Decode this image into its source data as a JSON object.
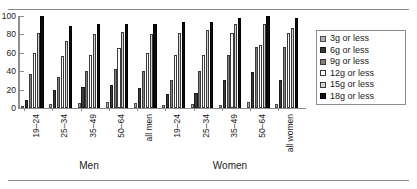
{
  "chart_data": {
    "type": "bar",
    "title": "",
    "xlabel": "",
    "ylabel": "",
    "ylim": [
      0,
      100
    ],
    "yticks": [
      0,
      20,
      40,
      60,
      80,
      100
    ],
    "grid": false,
    "legend_position": "right",
    "categories": [
      "19–24",
      "25–34",
      "35–49",
      "50–64",
      "all men",
      "19–24",
      "25–34",
      "35–49",
      "50–64",
      "all women"
    ],
    "group_titles": [
      "Men",
      "Women"
    ],
    "series": [
      {
        "name": "3g or less",
        "values": [
          1,
          4,
          5,
          6,
          5,
          3,
          4,
          3,
          7,
          4
        ]
      },
      {
        "name": "6g or less",
        "values": [
          9,
          20,
          23,
          25,
          22,
          15,
          16,
          30,
          39,
          30
        ]
      },
      {
        "name": "9g or less",
        "values": [
          37,
          34,
          40,
          42,
          40,
          30,
          40,
          58,
          66,
          66
        ]
      },
      {
        "name": "12g or less",
        "values": [
          60,
          57,
          58,
          65,
          60,
          58,
          58,
          82,
          69,
          81
        ]
      },
      {
        "name": "15g or less",
        "values": [
          81,
          73,
          80,
          83,
          80,
          82,
          85,
          91,
          91,
          87
        ]
      },
      {
        "name": "18g or less",
        "values": [
          100,
          89,
          91,
          91,
          91,
          93,
          93,
          98,
          100,
          98
        ]
      }
    ]
  },
  "legend": {
    "items": [
      {
        "label": "3g or less",
        "color": "#b0b0b0"
      },
      {
        "label": "6g or less",
        "color": "#3a3a3a"
      },
      {
        "label": "9g or less",
        "color": "#808080"
      },
      {
        "label": "12g or less",
        "color": "#ffffff"
      },
      {
        "label": "15g or less",
        "color": "#d4d4d4"
      },
      {
        "label": "18g or less",
        "color": "#0d0d0d"
      }
    ]
  }
}
